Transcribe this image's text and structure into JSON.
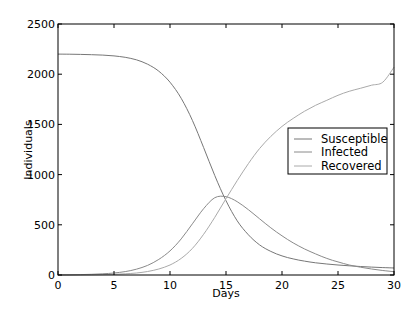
{
  "chart_data": {
    "type": "line",
    "title": "",
    "xlabel": "Days",
    "ylabel": "Individuals",
    "xlim": [
      0,
      30
    ],
    "ylim": [
      0,
      2500
    ],
    "xticks": [
      0,
      5,
      10,
      15,
      20,
      25,
      30
    ],
    "yticks": [
      0,
      500,
      1000,
      1500,
      2000,
      2500
    ],
    "grid": false,
    "legend_position": "center right",
    "x": [
      0,
      1,
      2,
      3,
      4,
      5,
      6,
      7,
      8,
      9,
      10,
      11,
      12,
      13,
      14,
      15,
      16,
      17,
      18,
      19,
      20,
      21,
      22,
      23,
      24,
      25,
      26,
      27,
      28,
      29,
      30
    ],
    "series": [
      {
        "name": "Susceptible",
        "color": "#777777",
        "values": [
          2200,
          2199,
          2197,
          2194,
          2190,
          2182,
          2168,
          2143,
          2100,
          2030,
          1920,
          1760,
          1540,
          1270,
          990,
          740,
          540,
          400,
          300,
          235,
          190,
          160,
          138,
          122,
          110,
          100,
          92,
          85,
          79,
          74,
          70
        ]
      },
      {
        "name": "Infected",
        "color": "#8a8a8a",
        "values": [
          1,
          2,
          4,
          7,
          12,
          20,
          34,
          58,
          96,
          155,
          240,
          360,
          510,
          660,
          770,
          780,
          730,
          650,
          560,
          470,
          390,
          320,
          260,
          210,
          165,
          130,
          100,
          78,
          60,
          45,
          33
        ]
      },
      {
        "name": "Recovered",
        "color": "#aaaaaa",
        "values": [
          0,
          0,
          1,
          2,
          4,
          7,
          12,
          20,
          35,
          60,
          100,
          165,
          265,
          405,
          575,
          760,
          940,
          1110,
          1260,
          1380,
          1480,
          1560,
          1630,
          1690,
          1740,
          1790,
          1830,
          1860,
          1890,
          1920,
          2070
        ]
      }
    ]
  },
  "legend": {
    "items": [
      {
        "label": "Susceptible",
        "color": "#777777"
      },
      {
        "label": "Infected",
        "color": "#8a8a8a"
      },
      {
        "label": "Recovered",
        "color": "#aaaaaa"
      }
    ]
  },
  "axes": {
    "xlabel": "Days",
    "ylabel": "Individuals",
    "xtick_labels": [
      "0",
      "5",
      "10",
      "15",
      "20",
      "25",
      "30"
    ],
    "ytick_labels": [
      "0",
      "500",
      "1000",
      "1500",
      "2000",
      "2500"
    ]
  }
}
